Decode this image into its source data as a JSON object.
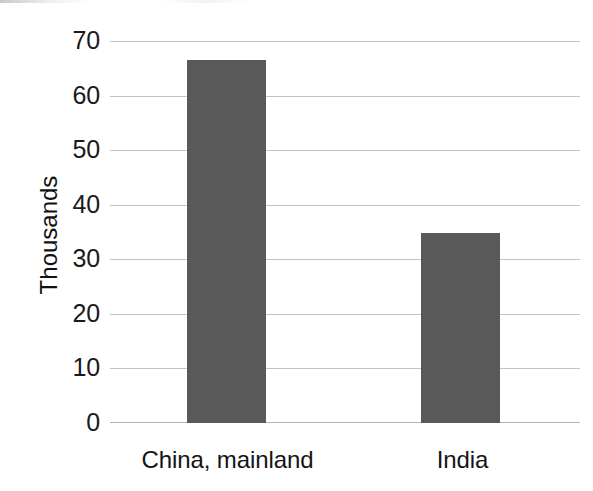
{
  "chart_data": {
    "type": "bar",
    "title": "",
    "subtitle": "",
    "xlabel": "",
    "ylabel": "Thousands",
    "categories": [
      "China, mainland",
      "India"
    ],
    "values": [
      66.5,
      34.8
    ],
    "series": [
      {
        "name": "",
        "values": [
          66.5,
          34.8
        ]
      }
    ],
    "ylim": [
      0,
      70
    ],
    "y_ticks": [
      0,
      10,
      20,
      30,
      40,
      50,
      60,
      70
    ],
    "y_tick_labels": [
      "0",
      "10",
      "20",
      "30",
      "40",
      "50",
      "60",
      "70"
    ],
    "grid": true,
    "grid_axis": "y",
    "legend": false,
    "legend_position": "none",
    "bar_color": "#595959",
    "gridline_color": "#b9b9b9",
    "axis_text_color": "#1a1a1a",
    "background_color": "#ffffff",
    "annotations": []
  },
  "axis": {
    "y_title": "Thousands"
  }
}
